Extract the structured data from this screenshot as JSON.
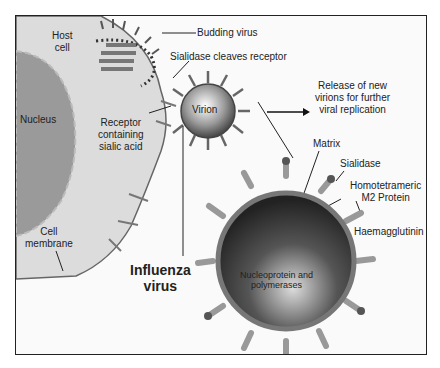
{
  "diagram": {
    "labels": {
      "host_cell": [
        "Host",
        "cell"
      ],
      "nucleus": "Nucleus",
      "budding_virus": "Budding virus",
      "sialidase_cleaves": "Sialidase cleaves receptor",
      "virion": "Virion",
      "receptor": [
        "Receptor",
        "containing",
        "sialic acid"
      ],
      "release": [
        "Release of new",
        "virions for further",
        "viral replication"
      ],
      "cell_membrane": [
        "Cell",
        "membrane"
      ],
      "influenza_virus": [
        "Influenza",
        "virus"
      ],
      "matrix": "Matrix",
      "sialidase": "Sialidase",
      "m2": [
        "Homotetrameric",
        "M2 Protein"
      ],
      "haemagglutinin": "Haemagglutinin",
      "nucleoprotein": [
        "Nucleoprotein and",
        "polymerases"
      ]
    },
    "colors": {
      "frame": "#222222",
      "cell": "#dcdcdc",
      "nucleus": "#9a9a9a",
      "virus_dark": "#333333"
    }
  }
}
